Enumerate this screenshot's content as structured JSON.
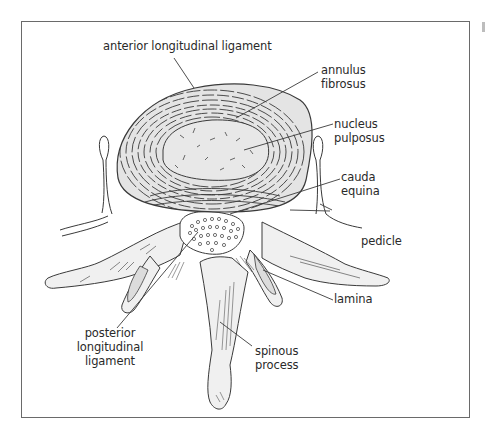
{
  "diagram": {
    "colors": {
      "line": "#3a3a3a",
      "fill_disc": "#e4e4e4",
      "fill_nucleus": "#e8e8e8",
      "fill_bone": "#f0f0f0",
      "frame": "#6a6a6a",
      "background": "#ffffff"
    },
    "labels": {
      "anterior_longitudinal_ligament": "anterior longitudinal ligament",
      "annulus_fibrosus_1": "annulus",
      "annulus_fibrosus_2": "fibrosus",
      "nucleus_pulposus_1": "nucleus",
      "nucleus_pulposus_2": "pulposus",
      "cauda_equina_1": "cauda",
      "cauda_equina_2": "equina",
      "pedicle": "pedicle",
      "lamina": "lamina",
      "posterior_longitudinal_ligament_1": "posterior",
      "posterior_longitudinal_ligament_2": "longitudinal",
      "posterior_longitudinal_ligament_3": "ligament",
      "spinous_process_1": "spinous",
      "spinous_process_2": "process"
    }
  }
}
